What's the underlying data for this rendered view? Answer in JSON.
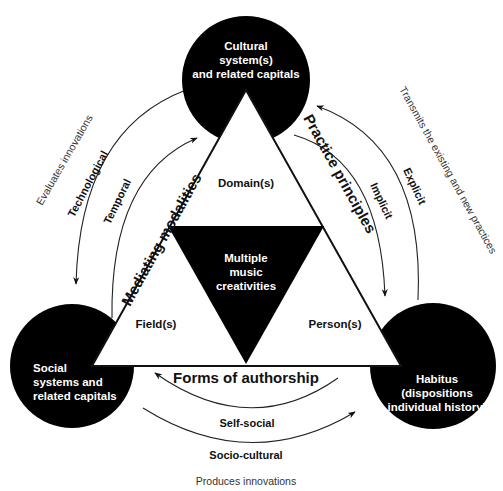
{
  "diagram": {
    "nodes": {
      "top": {
        "lines": [
          "Cultural",
          "system(s)",
          "and related capitals"
        ]
      },
      "bottom_left": {
        "lines": [
          "Social",
          "systems and",
          "related capitals"
        ]
      },
      "bottom_right": {
        "lines": [
          "Habitus",
          "(dispositions",
          "individual history)"
        ]
      }
    },
    "triangle": {
      "sides": {
        "left": "Mediating modalities",
        "right": "Practice principles",
        "bottom": "Forms of authorship"
      },
      "regions": {
        "top": "Domain(s)",
        "left": "Field(s)",
        "right": "Person(s)"
      },
      "center": {
        "lines": [
          "Multiple",
          "music",
          "creativities"
        ]
      }
    },
    "arrows": {
      "left_outer": "Technological",
      "left_inner": "Temporal",
      "right_outer": "Explicit",
      "right_inner": "Implicit",
      "bottom_inner": "Self-social",
      "bottom_outer": "Socio-cultural"
    },
    "annotations": {
      "left": "Evaluates innovations",
      "right": "Transmits the existing and new practices",
      "bottom": "Produces innovations"
    },
    "colors": {
      "fill": "#000000",
      "background": "#ffffff",
      "line": "#222222"
    }
  }
}
